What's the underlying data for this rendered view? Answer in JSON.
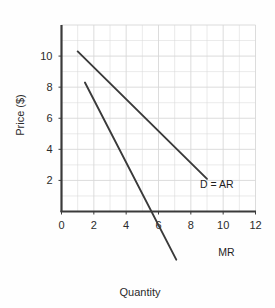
{
  "figure": {
    "background_color": "#fefefe",
    "plot_background_color": "#ffffff",
    "grid_color": "#d8d8d8",
    "axis_color": "#3a3a3a",
    "curve_color": "#3a3a3a"
  },
  "chart_data": {
    "type": "line",
    "title": "",
    "subtitle": "",
    "xlabel": "Quantity",
    "ylabel": "Price ($)",
    "xlim": [
      0,
      12
    ],
    "ylim": [
      0,
      12
    ],
    "xticks": [
      "0",
      "2",
      "4",
      "6",
      "8",
      "10",
      "12"
    ],
    "xtick_values": [
      0,
      2,
      4,
      6,
      8,
      10,
      12
    ],
    "yticks": [
      "2",
      "4",
      "6",
      "8",
      "10"
    ],
    "ytick_values": [
      2,
      4,
      6,
      8,
      10
    ],
    "grid": true,
    "grid_minor_spacing": 1,
    "legend": "none",
    "series": [
      {
        "name": "D = AR",
        "label": "D = AR",
        "label_x": 9.6,
        "label_y": 1.75,
        "x": [
          1.0,
          9.0
        ],
        "y": [
          10.3,
          2.1
        ]
      },
      {
        "name": "MR",
        "label": "MR",
        "label_x": 10.2,
        "label_y": -2.6,
        "x": [
          1.45,
          7.1
        ],
        "y": [
          8.3,
          -3.1
        ]
      }
    ],
    "annotations": [
      {
        "text": "D = AR",
        "x": 9.6,
        "y": 1.75
      },
      {
        "text": "MR",
        "x": 10.2,
        "y": -2.6
      }
    ]
  },
  "axes": {
    "x_axis_title": "Quantity",
    "y_axis_title": "Price ($)"
  }
}
